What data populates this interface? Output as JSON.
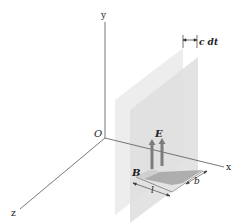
{
  "diagram": {
    "type": "3d-coordinate-diagram",
    "axes": {
      "origin_label": "O",
      "x_label": "x",
      "y_label": "y",
      "z_label": "z"
    },
    "labels": {
      "separation": "c dt",
      "electric_field": "E",
      "magnetic_field": "B",
      "length": "l",
      "width": "b"
    },
    "colors": {
      "axis": "#555555",
      "plane_back": "#e6e6e6",
      "plane_front": "#dcdcdc",
      "strip": "#9a9a9a",
      "arrow": "#7d7d7d",
      "text": "#222222"
    }
  }
}
